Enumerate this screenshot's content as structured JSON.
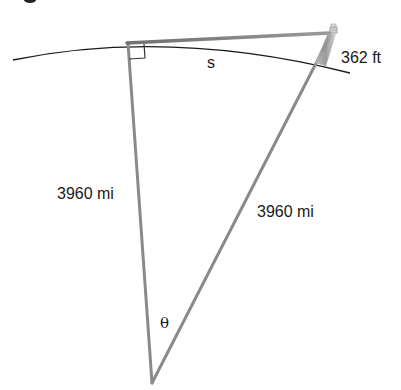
{
  "diagram": {
    "title": "",
    "labels": {
      "arc_length": "s",
      "tower_height": "362 ft",
      "left_radius": "3960 mi",
      "right_radius": "3960 mi",
      "angle": "θ"
    },
    "vertices": {
      "tangent_point": [
        127,
        43
      ],
      "tower_top": [
        333,
        33
      ],
      "earth_center": [
        152,
        383
      ]
    },
    "colors": {
      "triangle_stroke": "#8a8a8a",
      "arc_stroke": "#1a1a1a",
      "text": "#1a1a1a",
      "background": "#ffffff"
    }
  }
}
